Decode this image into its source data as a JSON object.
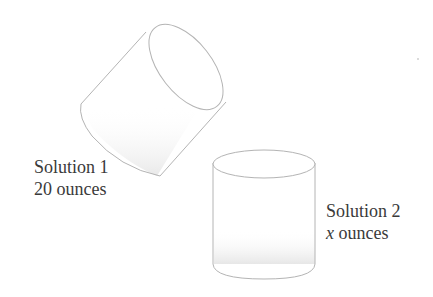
{
  "diagram": {
    "containers": [
      {
        "id": "solution-1",
        "label_line1": "Solution 1",
        "amount_value": "20",
        "amount_unit": "ounces",
        "orientation": "tilted"
      },
      {
        "id": "solution-2",
        "label_line1": "Solution 2",
        "amount_value": "x",
        "amount_unit": "ounces",
        "orientation": "upright"
      }
    ],
    "colors": {
      "outline": "#b4b4b4",
      "text": "#3a3a3a",
      "shade": "#eeeeee",
      "background": "#ffffff"
    }
  }
}
